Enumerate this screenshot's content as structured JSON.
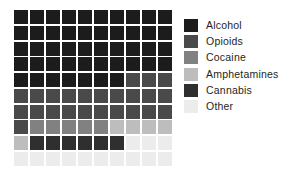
{
  "chart_data": {
    "type": "waffle",
    "title": "",
    "subtitle": "",
    "xlabel": "",
    "ylabel": "",
    "grid_rows": 10,
    "grid_cols": 10,
    "total_cells": 100,
    "fill_order": "row-major-left-to-right-top-to-bottom",
    "categories": [
      "Alcohol",
      "Opioids",
      "Cocaine",
      "Amphetamines",
      "Cannabis",
      "Other"
    ],
    "values": [
      47,
      24,
      5,
      5,
      6,
      13
    ],
    "unit": "cells (percent of total)",
    "colors": [
      "#1c1c1c",
      "#4a4a4a",
      "#818181",
      "#bdbdbd",
      "#2f2f2f",
      "#ececec"
    ],
    "legend_position": "right",
    "grid": false,
    "cell_sequence": [
      0,
      0,
      0,
      0,
      0,
      0,
      0,
      0,
      0,
      0,
      0,
      0,
      0,
      0,
      0,
      0,
      0,
      0,
      0,
      0,
      0,
      0,
      0,
      0,
      0,
      0,
      0,
      0,
      0,
      0,
      0,
      0,
      0,
      0,
      0,
      0,
      0,
      0,
      0,
      0,
      0,
      0,
      0,
      0,
      0,
      0,
      0,
      1,
      1,
      1,
      1,
      1,
      1,
      1,
      1,
      1,
      1,
      1,
      1,
      1,
      1,
      1,
      1,
      1,
      1,
      1,
      1,
      1,
      1,
      1,
      1,
      2,
      2,
      2,
      2,
      2,
      3,
      3,
      3,
      3,
      3,
      4,
      4,
      4,
      4,
      4,
      4,
      5,
      5,
      5,
      5,
      5,
      5,
      5,
      5,
      5,
      5,
      5,
      5,
      5
    ]
  },
  "legend": {
    "items": [
      {
        "label": "Alcohol",
        "color": "#1c1c1c",
        "value": 47
      },
      {
        "label": "Opioids",
        "color": "#4a4a4a",
        "value": 24
      },
      {
        "label": "Cocaine",
        "color": "#818181",
        "value": 5
      },
      {
        "label": "Amphetamines",
        "color": "#bdbdbd",
        "value": 5
      },
      {
        "label": "Cannabis",
        "color": "#2f2f2f",
        "value": 6
      },
      {
        "label": "Other",
        "color": "#ececec",
        "value": 13
      }
    ]
  },
  "background_color": "#ffffff",
  "text_color": "#231f20"
}
